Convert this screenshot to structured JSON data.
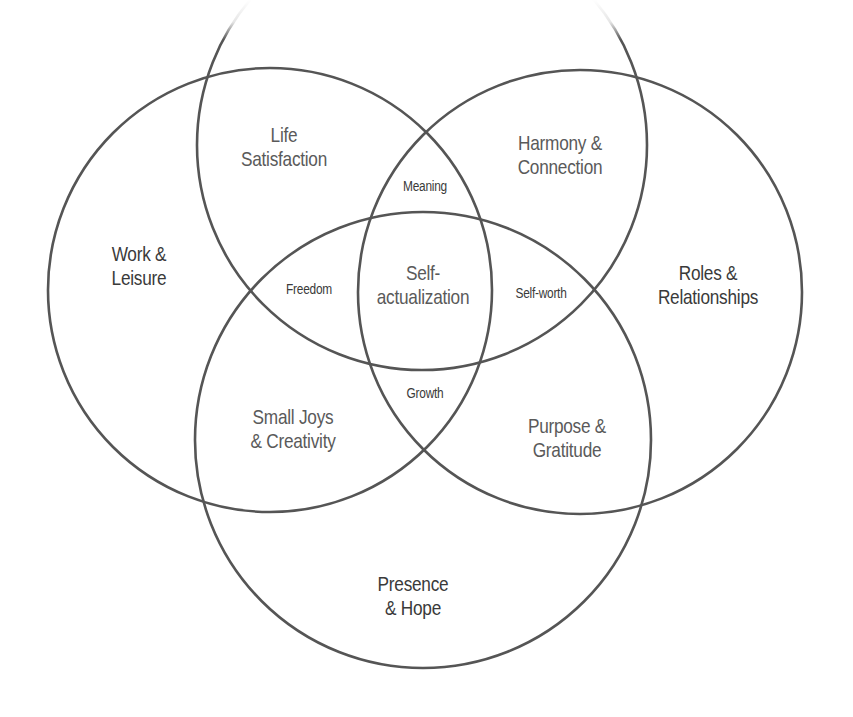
{
  "diagram": {
    "type": "venn",
    "sets": 4,
    "stroke_color": "#555555",
    "background": "#ffffff",
    "circles": [
      {
        "id": "top",
        "cx": 422,
        "cy": 145,
        "r": 225
      },
      {
        "id": "left",
        "cx": 270,
        "cy": 290,
        "r": 222
      },
      {
        "id": "right",
        "cx": 580,
        "cy": 292,
        "r": 222
      },
      {
        "id": "bottom",
        "cx": 423,
        "cy": 440,
        "r": 228
      }
    ],
    "regions": {
      "work_leisure": {
        "line1": "Work &",
        "line2": "Leisure"
      },
      "life_satisfaction": {
        "line1": "Life",
        "line2": "Satisfaction"
      },
      "harmony_connection": {
        "line1": "Harmony &",
        "line2": "Connection"
      },
      "roles_relationships": {
        "line1": "Roles &",
        "line2": "Relationships"
      },
      "meaning": {
        "line1": "Meaning"
      },
      "freedom": {
        "line1": "Freedom"
      },
      "self_actualization": {
        "line1": "Self-",
        "line2": "actualization"
      },
      "self_worth": {
        "line1": "Self-worth"
      },
      "growth": {
        "line1": "Growth"
      },
      "small_joys": {
        "line1": "Small Joys",
        "line2": "& Creativity"
      },
      "purpose_gratitude": {
        "line1": "Purpose &",
        "line2": "Gratitude"
      },
      "presence_hope": {
        "line1": "Presence",
        "line2": "& Hope"
      }
    }
  }
}
